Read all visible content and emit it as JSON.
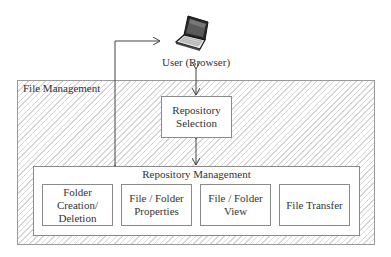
{
  "diagram": {
    "user": {
      "label": "User (Browser)",
      "icon": "laptop-icon"
    },
    "container": {
      "label": "File Management"
    },
    "repository_selection": {
      "label_line1": "Repository",
      "label_line2": "Selection"
    },
    "repository_management": {
      "label": "Repository Management",
      "modules": [
        {
          "line1": "Folder",
          "line2": "Creation/",
          "line3": "Deletion"
        },
        {
          "line1": "File / Folder",
          "line2": "Properties"
        },
        {
          "line1": "File / Folder",
          "line2": "View"
        },
        {
          "line1": "File Transfer"
        }
      ]
    },
    "connections": [
      {
        "from": "User (Browser)",
        "to": "Repository Selection",
        "type": "bidirectional"
      },
      {
        "from": "Repository Selection",
        "to": "Repository Management",
        "type": "bidirectional"
      },
      {
        "from": "Repository Management",
        "to": "User (Browser)",
        "type": "directed-path"
      }
    ]
  }
}
